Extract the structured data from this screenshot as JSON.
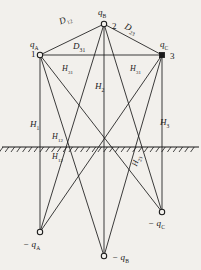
{
  "figure": {
    "type": "electrostatic-line-diagram",
    "width": 201,
    "height": 270,
    "background_color": "#f2f0ec",
    "line_color": "#1a1a1a",
    "ground_line_y": 147
  },
  "nodes": [
    {
      "id": "1",
      "name": "conductor-a",
      "charge_label": "q",
      "charge_sub": "A",
      "number": "1",
      "x": 40,
      "y": 55,
      "marker": "circle"
    },
    {
      "id": "2",
      "name": "conductor-b",
      "charge_label": "q",
      "charge_sub": "B",
      "number": "2",
      "x": 104,
      "y": 24,
      "marker": "circle"
    },
    {
      "id": "3",
      "name": "conductor-c",
      "charge_label": "q",
      "charge_sub": "C",
      "number": "3",
      "x": 162,
      "y": 55,
      "marker": "square"
    }
  ],
  "image_nodes": [
    {
      "id": "-1",
      "name": "image-charge-a",
      "charge_label": "− q",
      "charge_sub": "A",
      "x": 40,
      "y": 232,
      "marker": "circle"
    },
    {
      "id": "-2",
      "name": "image-charge-b",
      "charge_label": "− q",
      "charge_sub": "B",
      "x": 104,
      "y": 256,
      "marker": "circle"
    },
    {
      "id": "-3",
      "name": "image-charge-c",
      "charge_label": "− q",
      "charge_sub": "C",
      "x": 162,
      "y": 212,
      "marker": "circle"
    }
  ],
  "labels": {
    "q_a": {
      "text": "q",
      "sub": "A",
      "x": 30,
      "y": 40
    },
    "q_b": {
      "text": "q",
      "sub": "B",
      "x": 98,
      "y": 8
    },
    "q_c": {
      "text": "q",
      "sub": "C",
      "x": 160,
      "y": 40
    },
    "num_1": {
      "text": "1",
      "x": 31,
      "y": 50
    },
    "num_2": {
      "text": "2",
      "x": 112,
      "y": 22
    },
    "num_3": {
      "text": "3",
      "x": 170,
      "y": 52
    },
    "neg_q_a": {
      "text": "− q",
      "sub": "A",
      "x": 23,
      "y": 240
    },
    "neg_q_b": {
      "text": "− q",
      "sub": "B",
      "x": 112,
      "y": 253
    },
    "neg_q_c": {
      "text": "− q",
      "sub": "C",
      "x": 148,
      "y": 219
    },
    "d_12": {
      "text": "D",
      "sub": "12",
      "x": 58,
      "y": 18,
      "rotate": -22
    },
    "d_23": {
      "text": "D",
      "sub": "23",
      "x": 127,
      "y": 22,
      "rotate": 26
    },
    "d_31": {
      "text": "D",
      "sub": "31",
      "x": 73,
      "y": 42,
      "rotate": 0
    },
    "h_1": {
      "text": "H",
      "sub": "1",
      "x": 30,
      "y": 120
    },
    "h_2": {
      "text": "H",
      "sub": "2",
      "x": 95,
      "y": 82
    },
    "h_3": {
      "text": "H",
      "sub": "3",
      "x": 160,
      "y": 118
    },
    "h_31_left": {
      "text": "H",
      "sub": "31",
      "x": 62,
      "y": 65
    },
    "h_31_right": {
      "text": "H",
      "sub": "31",
      "x": 130,
      "y": 65
    },
    "h_12_above": {
      "text": "H",
      "sub": "12",
      "x": 52,
      "y": 133
    },
    "h_12_below": {
      "text": "H",
      "sub": "12",
      "x": 52,
      "y": 153
    },
    "h_23": {
      "text": "H",
      "sub": "23",
      "x": 131,
      "y": 165,
      "rotate": -72
    }
  },
  "edges": [
    {
      "name": "edge-1-2",
      "from": "1",
      "to": "2"
    },
    {
      "name": "edge-2-3",
      "from": "2",
      "to": "3"
    },
    {
      "name": "edge-3-1",
      "from": "3",
      "to": "1"
    },
    {
      "name": "edge-1-img1",
      "from": "1",
      "to": "-1"
    },
    {
      "name": "edge-2-img2",
      "from": "2",
      "to": "-2"
    },
    {
      "name": "edge-3-img3",
      "from": "3",
      "to": "-3"
    },
    {
      "name": "edge-1-img2",
      "from": "1",
      "to": "-2"
    },
    {
      "name": "edge-1-img3",
      "from": "1",
      "to": "-3"
    },
    {
      "name": "edge-2-img1",
      "from": "2",
      "to": "-1"
    },
    {
      "name": "edge-2-img3",
      "from": "2",
      "to": "-3"
    },
    {
      "name": "edge-3-img1",
      "from": "3",
      "to": "-1"
    },
    {
      "name": "edge-3-img2",
      "from": "3",
      "to": "-2"
    }
  ],
  "ground": {
    "name": "ground-plane",
    "y": 147,
    "x_start": 2,
    "x_end": 199,
    "hatch_count": 34
  }
}
